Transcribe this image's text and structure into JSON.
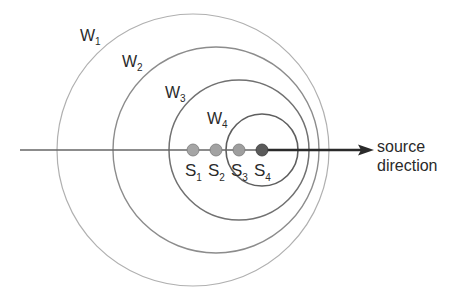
{
  "diagram": {
    "axis": {
      "label_line1": "source",
      "label_line2": "direction",
      "y": 150,
      "x_start": 20,
      "x_end": 372
    },
    "wavefronts": [
      {
        "id": "W1",
        "letter": "W",
        "sub": "1",
        "cx": 193,
        "cy": 150,
        "r": 136,
        "color": "#a8a8a8",
        "label_x": 80,
        "label_y": 41
      },
      {
        "id": "W2",
        "letter": "W",
        "sub": "2",
        "cx": 216,
        "cy": 150,
        "r": 103,
        "color": "#8a8a8a",
        "label_x": 122,
        "label_y": 67
      },
      {
        "id": "W3",
        "letter": "W",
        "sub": "3",
        "cx": 239,
        "cy": 150,
        "r": 70,
        "color": "#6e6e6e",
        "label_x": 165,
        "label_y": 98
      },
      {
        "id": "W4",
        "letter": "W",
        "sub": "4",
        "cx": 262,
        "cy": 150,
        "r": 36,
        "color": "#5a5a5a",
        "label_x": 207,
        "label_y": 124
      }
    ],
    "sources": [
      {
        "id": "S1",
        "letter": "S",
        "sub": "1",
        "cx": 193,
        "cy": 150,
        "fill": "#a3a3a3"
      },
      {
        "id": "S2",
        "letter": "S",
        "sub": "2",
        "cx": 216,
        "cy": 150,
        "fill": "#a0a0a0"
      },
      {
        "id": "S3",
        "letter": "S",
        "sub": "3",
        "cx": 239,
        "cy": 150,
        "fill": "#9c9c9c"
      },
      {
        "id": "S4",
        "letter": "S",
        "sub": "4",
        "cx": 262,
        "cy": 150,
        "fill": "#5c5c5c"
      }
    ]
  }
}
